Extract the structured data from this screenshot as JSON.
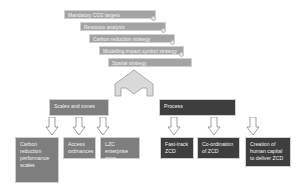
{
  "stack": {
    "bars": [
      {
        "label": "Mandatory CO2 targets"
      },
      {
        "label": "Resource analysis"
      },
      {
        "label": "Carbon reduction strategy"
      },
      {
        "label": "Modelling impact symbol strategy"
      },
      {
        "label": "Spatial strategy"
      }
    ]
  },
  "left_branch": {
    "title": "Scales and zones",
    "children": [
      {
        "label": "Carbon reduction performance scales"
      },
      {
        "label": "Access ordinances"
      },
      {
        "label": "LZC enterprise zone"
      }
    ]
  },
  "right_branch": {
    "title": "Process",
    "children": [
      {
        "label": "Fast-track ZCD"
      },
      {
        "label": "Co-ordination of ZCD"
      },
      {
        "label": "Creation of human capital to deliver ZCD"
      }
    ]
  },
  "colors": {
    "bar_fill": "#a3a3a3",
    "left_fill": "#7e7e7e",
    "right_fill": "#3e3e3e",
    "arrow_fill": "#d9d9d9"
  }
}
